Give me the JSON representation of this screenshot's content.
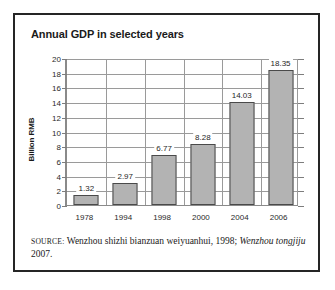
{
  "figure": {
    "title": "Annual GDP in selected years",
    "source": {
      "label": "Source:",
      "text_part1": " Wenzhou shizhi bianzuan weiyuanhui, 1998; ",
      "italic1": "Wenzhou tongjiju",
      "text_part2": " 2007."
    }
  },
  "chart_data": {
    "type": "bar",
    "title": "Annual GDP in selected years",
    "xlabel": "",
    "ylabel": "Billion RMB",
    "categories": [
      "1978",
      "1994",
      "1998",
      "2000",
      "2004",
      "2006"
    ],
    "values": [
      1.32,
      2.97,
      6.77,
      8.28,
      14.03,
      18.35
    ],
    "value_labels": [
      "1.32",
      "2.97",
      "6.77",
      "8.28",
      "14.03",
      "18.35"
    ],
    "ylim": [
      0,
      20
    ],
    "yticks": [
      0,
      2,
      4,
      6,
      8,
      10,
      12,
      14,
      16,
      18,
      20
    ],
    "ytick_labels": [
      "0",
      "2",
      "4",
      "6",
      "8",
      "10",
      "12",
      "14",
      "16",
      "18",
      "20"
    ],
    "grid": "horizontal-and-vertical",
    "legend": "none",
    "bar_color": "#b3b3b3",
    "bar_edge_color": "#4a4a4a",
    "axis_color": "#8a8a8a",
    "gridline_color": "#9a9a9a",
    "text_color": "#1a1a1a"
  }
}
